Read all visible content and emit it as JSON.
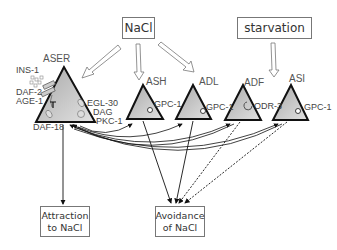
{
  "stimuli": {
    "nacl": "NaCl",
    "starvation": "starvation"
  },
  "neurons": [
    {
      "name": "ASER",
      "molecules": [
        "EGL-30",
        "DAG",
        "PKC-1"
      ],
      "left_labels": [
        "INS-1",
        "DAF-2",
        "AGE-1",
        "DAF-18"
      ]
    },
    {
      "name": "ASH",
      "molecules": [
        "GPC-1"
      ]
    },
    {
      "name": "ADL",
      "molecules": [
        "GPC-1"
      ]
    },
    {
      "name": "ADF",
      "molecules": [
        "ODR-3"
      ]
    },
    {
      "name": "ASI",
      "molecules": [
        "GPC-1"
      ]
    }
  ],
  "labels": {
    "aser": "ASER",
    "ins1": "INS-1",
    "daf2": "DAF-2",
    "age1": "AGE-1",
    "daf18": "DAF-18",
    "egl30": "EGL-30",
    "dag": "DAG",
    "pkc1": "PKC-1",
    "ash": "ASH",
    "ash_gpc": "GPC-1",
    "adl": "ADL",
    "adl_gpc": "GPC-1",
    "adf": "ADF",
    "adf_odr": "ODR-3",
    "asi": "ASI",
    "asi_gpc": "GPC-1"
  },
  "outputs": {
    "attraction_line1": "Attraction",
    "attraction_line2": "to NaCl",
    "avoidance_line1": "Avoidance",
    "avoidance_line2": "of NaCl"
  },
  "colors": {
    "triangle_fill_top": "#b9b9b9",
    "triangle_fill_bottom": "#dcdcdc",
    "outline": "#111111",
    "box_border": "#777777",
    "text": "#444444"
  }
}
